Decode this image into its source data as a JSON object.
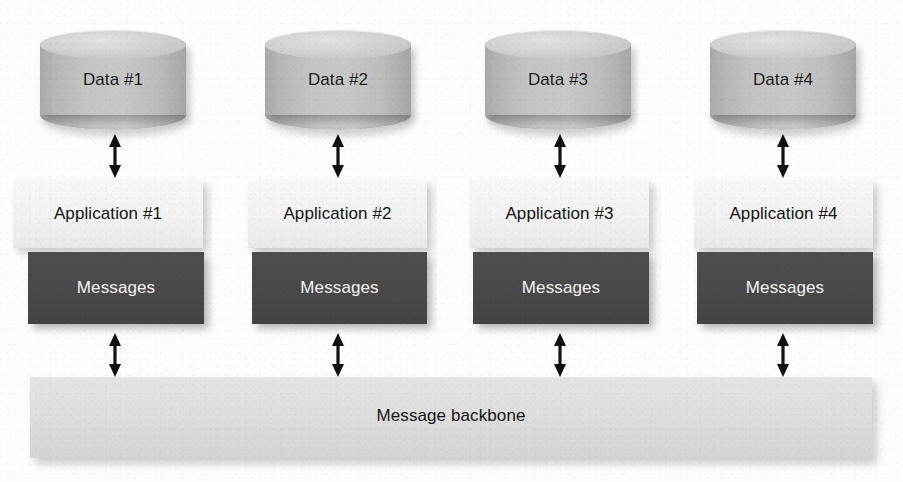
{
  "diagram": {
    "canvas": {
      "width": 903,
      "height": 482,
      "background": "#fefefe"
    },
    "colors": {
      "cylinder_body": "#c4c4c4",
      "cylinder_top": "#d3d3d3",
      "application_box": "#f2f2f2",
      "application_text": "#141414",
      "messages_box": "#4a4a4a",
      "messages_text": "#f4f4f4",
      "backbone_bar": "#dedede",
      "backbone_text": "#161616",
      "arrow": "#111111"
    },
    "columns": [
      {
        "data_label": "Data #1",
        "application_label": "Application #1",
        "messages_label": "Messages",
        "upper_arrow": "double-headed-vertical-arrow",
        "lower_arrow": "double-headed-vertical-arrow"
      },
      {
        "data_label": "Data #2",
        "application_label": "Application #2",
        "messages_label": "Messages",
        "upper_arrow": "double-headed-vertical-arrow",
        "lower_arrow": "double-headed-vertical-arrow"
      },
      {
        "data_label": "Data #3",
        "application_label": "Application #3",
        "messages_label": "Messages",
        "upper_arrow": "double-headed-vertical-arrow",
        "lower_arrow": "double-headed-vertical-arrow"
      },
      {
        "data_label": "Data #4",
        "application_label": "Application #4",
        "messages_label": "Messages",
        "upper_arrow": "double-headed-vertical-arrow",
        "lower_arrow": "double-headed-vertical-arrow"
      }
    ],
    "backbone": {
      "label": "Message backbone"
    }
  }
}
